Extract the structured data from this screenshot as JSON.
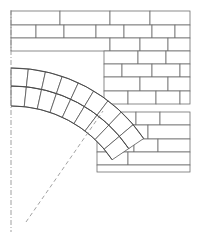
{
  "drawing": {
    "title": "Masonry Arch Construction Detail",
    "type": "technical-line-drawing",
    "canvas": {
      "width": 202,
      "height": 235,
      "background": "#ffffff"
    },
    "colors": {
      "brick_stroke": "#6e6e6e",
      "voussoir_stroke": "#555555",
      "arch_curve": "#444444",
      "centerline": "#888888",
      "radius_line": "#8a8a8a",
      "fill": "#ffffff"
    }
  },
  "centerline": {
    "label": "vertical-axis",
    "style": "dash-dot",
    "x": 11,
    "y1": 10,
    "y2": 232
  },
  "radius_line": {
    "label": "arch-radius",
    "style": "dashed",
    "x1": 26,
    "y1": 222,
    "x2": 103,
    "y2": 111
  },
  "arch": {
    "label": "two-ring-segmental-arch",
    "rings": 2,
    "voussoirs_per_ring": 9,
    "center": {
      "x": 11,
      "y": 228
    },
    "radii": {
      "intrados": 122,
      "middle": 142,
      "extrados": 160
    },
    "angle_start_deg": 0,
    "angle_end_deg": 56
  },
  "walls": {
    "upper": {
      "label": "upper-brick-wall",
      "x": 11,
      "y": 11,
      "width": 179,
      "height": 38,
      "rows": [
        {
          "y": 11,
          "height": 14,
          "joints": [
            60,
            110,
            150
          ]
        },
        {
          "y": 25,
          "height": 13,
          "joints": [
            36,
            64,
            96,
            124,
            152,
            175
          ]
        },
        {
          "y": 38,
          "height": 13,
          "joints": [
            110,
            140,
            168
          ]
        }
      ]
    },
    "middle_right": {
      "label": "middle-right-brick-wall",
      "x": 104,
      "y": 51,
      "width": 86,
      "height": 57,
      "rows": [
        {
          "y": 51,
          "height": 13,
          "joints": [
            138,
            166
          ]
        },
        {
          "y": 64,
          "height": 13,
          "joints": [
            122,
            152,
            180
          ]
        },
        {
          "y": 77,
          "height": 14,
          "joints": [
            140,
            168
          ]
        },
        {
          "y": 91,
          "height": 13,
          "joints": [
            128,
            156,
            180
          ]
        }
      ]
    },
    "lower_right": {
      "label": "lower-right-brick-wall",
      "x": 97,
      "y": 112,
      "width": 93,
      "height": 60,
      "rows": [
        {
          "y": 112,
          "height": 13,
          "joints": [
            120,
            136,
            160
          ]
        },
        {
          "y": 125,
          "height": 14,
          "joints": [
            148
          ]
        },
        {
          "y": 139,
          "height": 13,
          "joints": [
            120,
            134,
            158
          ]
        },
        {
          "y": 152,
          "height": 13,
          "joints": [
            128
          ]
        },
        {
          "y": 165,
          "height": 7,
          "joints": []
        }
      ]
    }
  }
}
